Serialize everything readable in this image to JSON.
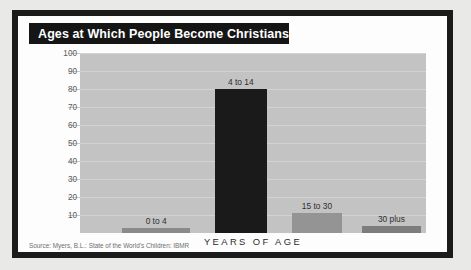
{
  "figure": {
    "title": "Ages at Which People Become Christians",
    "title_superscript": "28",
    "source": "Source: Myers, B.L.: State of the World's Children: IBMR",
    "colors": {
      "frame": "#1b1b1b",
      "panel": "#fdfdfd",
      "title_bar": "#151515",
      "plot_bg": "#c3c3c3",
      "gridline": "#d3d3d3",
      "page_bg": "#e9e9e7"
    }
  },
  "chart_data": {
    "type": "bar",
    "title": "Ages at Which People Become Christians",
    "xlabel": "YEARS OF AGE",
    "ylabel": "PERCENT OF POPULATION",
    "categories": [
      "0 to 4",
      "4 to 14",
      "15 to 30",
      "30 plus"
    ],
    "values": [
      3,
      80,
      11,
      4
    ],
    "bar_colors": [
      "#8a8a8a",
      "#1a1a1a",
      "#949494",
      "#7d7d7d"
    ],
    "ylim": [
      0,
      100
    ],
    "yticks": [
      10,
      20,
      30,
      40,
      50,
      60,
      70,
      80,
      90,
      100
    ],
    "grid": true,
    "legend": "none",
    "bars": [
      {
        "label": "0 to 4",
        "value": 3,
        "color": "#8a8a8a",
        "width_pct": 19.5,
        "center_pct": 22.0
      },
      {
        "label": "4 to 14",
        "value": 80,
        "color": "#1a1a1a",
        "width_pct": 15.0,
        "center_pct": 46.5
      },
      {
        "label": "15 to 30",
        "value": 11,
        "color": "#949494",
        "width_pct": 14.5,
        "center_pct": 68.5
      },
      {
        "label": "30 plus",
        "value": 4,
        "color": "#7d7d7d",
        "width_pct": 17.0,
        "center_pct": 90.0
      }
    ]
  }
}
